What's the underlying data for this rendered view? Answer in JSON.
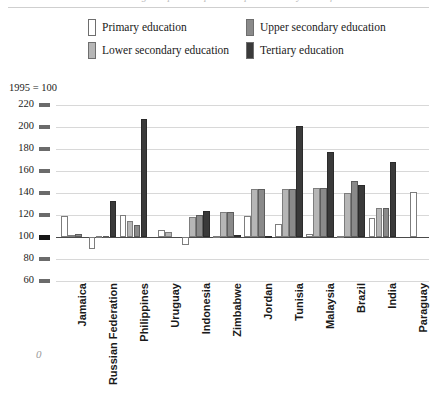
{
  "title": {
    "text": "Changes in public expenditure per student by level of education"
  },
  "axis_note": "1995 = 100",
  "legend": [
    {
      "key": "primary",
      "label": "Primary education",
      "color": "#ffffff"
    },
    {
      "key": "lower",
      "label": "Lower secondary education",
      "color": "#b6b6b6"
    },
    {
      "key": "upper",
      "label": "Upper secondary education",
      "color": "#8a8a8a"
    },
    {
      "key": "tertiary",
      "label": "Tertiary education",
      "color": "#3a3a3a"
    }
  ],
  "axis_arrow": "0",
  "chart_data": {
    "type": "bar",
    "title": "Changes in public expenditure per student by level of education",
    "subtitle": "1995 = 100",
    "xlabel": "",
    "ylabel": "1995 = 100",
    "ylim": [
      60,
      220
    ],
    "ytick_step": 20,
    "yticks": [
      60,
      80,
      100,
      120,
      140,
      160,
      180,
      200,
      220
    ],
    "ytick_labels": [
      "60",
      "80",
      "100",
      "120",
      "140",
      "160",
      "180",
      "200",
      "220"
    ],
    "grid": true,
    "baseline": 100,
    "legend_position": "top",
    "categories": [
      "Jamaica",
      "Russian Federation",
      "Philippines",
      "Uruguay",
      "Indonesia",
      "Zimbabwe",
      "Jordan",
      "Tunisia",
      "Malaysia",
      "Brazil",
      "India",
      "Paraguay"
    ],
    "series": [
      {
        "name": "Primary education",
        "color": "#ffffff",
        "values": [
          119,
          89,
          120,
          106,
          93,
          100,
          119,
          112,
          103,
          100,
          117,
          141
        ]
      },
      {
        "name": "Lower secondary education",
        "color": "#b6b6b6",
        "values": [
          102,
          100,
          115,
          105,
          118,
          123,
          144,
          144,
          145,
          140,
          126,
          null
        ]
      },
      {
        "name": "Upper secondary education",
        "color": "#8a8a8a",
        "values": [
          103,
          100,
          111,
          null,
          120,
          123,
          144,
          144,
          145,
          151,
          126,
          null
        ]
      },
      {
        "name": "Tertiary education",
        "color": "#3a3a3a",
        "values": [
          null,
          133,
          207,
          null,
          124,
          101,
          100,
          201,
          177,
          147,
          168,
          null
        ]
      }
    ]
  }
}
